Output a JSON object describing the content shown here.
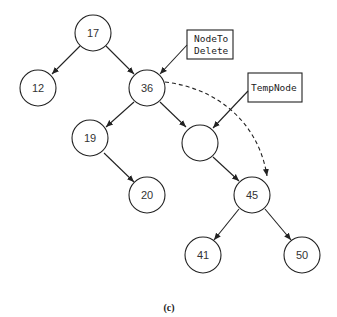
{
  "diagram": {
    "type": "binary-search-tree",
    "colors": {
      "stroke": "#222222",
      "text": "#333333",
      "background": "#ffffff"
    },
    "nodes": [
      {
        "id": "n17",
        "label": "17",
        "x": 93,
        "y": 33
      },
      {
        "id": "n12",
        "label": "12",
        "x": 38,
        "y": 88
      },
      {
        "id": "n36",
        "label": "36",
        "x": 147,
        "y": 88
      },
      {
        "id": "n19",
        "label": "19",
        "x": 90,
        "y": 138
      },
      {
        "id": "n20",
        "label": "20",
        "x": 147,
        "y": 195
      },
      {
        "id": "nEmpty",
        "label": "",
        "x": 200,
        "y": 143
      },
      {
        "id": "n45",
        "label": "45",
        "x": 252,
        "y": 195
      },
      {
        "id": "n41",
        "label": "41",
        "x": 203,
        "y": 255
      },
      {
        "id": "n50",
        "label": "50",
        "x": 302,
        "y": 255
      }
    ],
    "edges": [
      {
        "from": "n17",
        "to": "n12"
      },
      {
        "from": "n17",
        "to": "n36"
      },
      {
        "from": "n36",
        "to": "n19"
      },
      {
        "from": "n36",
        "to": "nEmpty"
      },
      {
        "from": "n19",
        "to": "n20"
      },
      {
        "from": "nEmpty",
        "to": "n45"
      },
      {
        "from": "n45",
        "to": "n41"
      },
      {
        "from": "n45",
        "to": "n50"
      }
    ],
    "pointers": [
      {
        "id": "node-to-delete",
        "lines": [
          "NodeTo",
          "Delete"
        ],
        "points_to": "n36"
      },
      {
        "id": "temp-node",
        "lines": [
          "TempNode"
        ],
        "points_to": "nEmpty"
      }
    ],
    "dashed_arrow": {
      "from": "n36",
      "to": "n45"
    },
    "caption": "(c)"
  }
}
